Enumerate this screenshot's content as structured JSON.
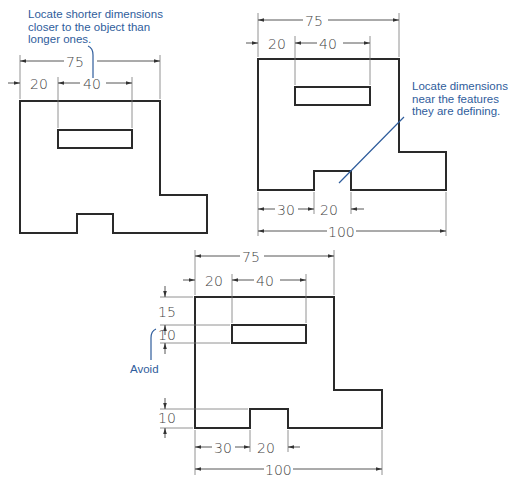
{
  "figures": [
    {
      "id": "fig-good-shorter-closer",
      "callout": "Locate shorter dimensions\ncloser to the object than\nlonger ones.",
      "dims": {
        "overall_width": "75",
        "left_offset": "20",
        "slot_width": "40"
      }
    },
    {
      "id": "fig-good-near-features",
      "callout": "Locate dimensions\nnear the features\nthey are defining.",
      "dims": {
        "overall_width": "75",
        "left_offset": "20",
        "slot_width": "40",
        "notch_offset": "30",
        "notch_width": "20",
        "base_width": "100"
      }
    },
    {
      "id": "fig-avoid",
      "callout": "Avoid",
      "dims": {
        "overall_width": "75",
        "left_offset": "20",
        "slot_width": "40",
        "top_offset": "15",
        "slot_height": "10",
        "notch_height": "10",
        "notch_offset": "30",
        "notch_width": "20",
        "base_width": "100"
      }
    }
  ],
  "colors": {
    "object_line": "#2a2a2a",
    "dim_line": "#555555",
    "callout_text": "#2f5d9c",
    "leader": "#2f5d9c"
  }
}
